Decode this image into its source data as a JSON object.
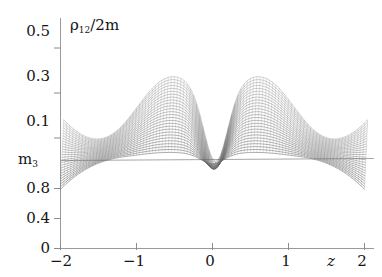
{
  "figure": {
    "background_color": "#ffffff",
    "mesh_color": "#6b6b6b",
    "axis_color": "#8c8c8c",
    "text_color": "#161616"
  },
  "axes": {
    "y_title": "ρ",
    "y_title_sub": "12",
    "y_title_rest": "/2m",
    "x_title": "z",
    "break_label": "m",
    "break_label_sub": "3",
    "y_upper_ticks": [
      "0.1",
      "0.3",
      "0.5"
    ],
    "y_lower_ticks": [
      "0",
      "0.4",
      "0.8"
    ],
    "x_ticks": [
      "−2",
      "−1",
      "0",
      "1",
      "2"
    ]
  },
  "chart_data": {
    "type": "line",
    "xlabel": "z",
    "ylabel": "ρ₁₂/2m",
    "grid": false,
    "legend": null,
    "xlim": [
      -2,
      2
    ],
    "ylim_upper": [
      0.0,
      0.55
    ],
    "ylim_lower": [
      0.0,
      1.0
    ],
    "axis_break_at": "m_3",
    "x": [
      -2.0,
      -1.9,
      -1.8,
      -1.7,
      -1.6,
      -1.5,
      -1.4,
      -1.3,
      -1.2,
      -1.1,
      -1.0,
      -0.9,
      -0.8,
      -0.7,
      -0.6,
      -0.5,
      -0.4,
      -0.3,
      -0.2,
      -0.1,
      0.0,
      0.1,
      0.2,
      0.3,
      0.4,
      0.5,
      0.6,
      0.7,
      0.8,
      0.9,
      1.0,
      1.1,
      1.2,
      1.3,
      1.4,
      1.5,
      1.6,
      1.7,
      1.8,
      1.9,
      2.0
    ],
    "series": [
      {
        "name": "upper envelope",
        "values": [
          0.13,
          0.142,
          0.157,
          0.175,
          0.197,
          0.223,
          0.253,
          0.288,
          0.325,
          0.363,
          0.398,
          0.427,
          0.447,
          0.458,
          0.462,
          0.461,
          0.455,
          0.444,
          0.43,
          0.416,
          0.408,
          0.416,
          0.43,
          0.444,
          0.455,
          0.461,
          0.462,
          0.458,
          0.447,
          0.427,
          0.398,
          0.363,
          0.325,
          0.288,
          0.253,
          0.223,
          0.197,
          0.175,
          0.157,
          0.142,
          0.13
        ]
      },
      {
        "name": "lower envelope",
        "values": [
          0.0,
          0.009,
          0.021,
          0.037,
          0.057,
          0.081,
          0.11,
          0.144,
          0.182,
          0.222,
          0.262,
          0.297,
          0.323,
          0.336,
          0.332,
          0.306,
          0.255,
          0.178,
          0.082,
          -0.02,
          -0.075,
          -0.02,
          0.082,
          0.178,
          0.255,
          0.306,
          0.332,
          0.336,
          0.323,
          0.297,
          0.262,
          0.222,
          0.182,
          0.144,
          0.11,
          0.081,
          0.057,
          0.037,
          0.021,
          0.009,
          0.0
        ]
      }
    ],
    "surface_profiles": 26,
    "peak_positions": [
      -0.6,
      0.6
    ],
    "peak_value": 0.462,
    "central_minimum_z": 0.0,
    "central_minimum_value": -0.075
  }
}
